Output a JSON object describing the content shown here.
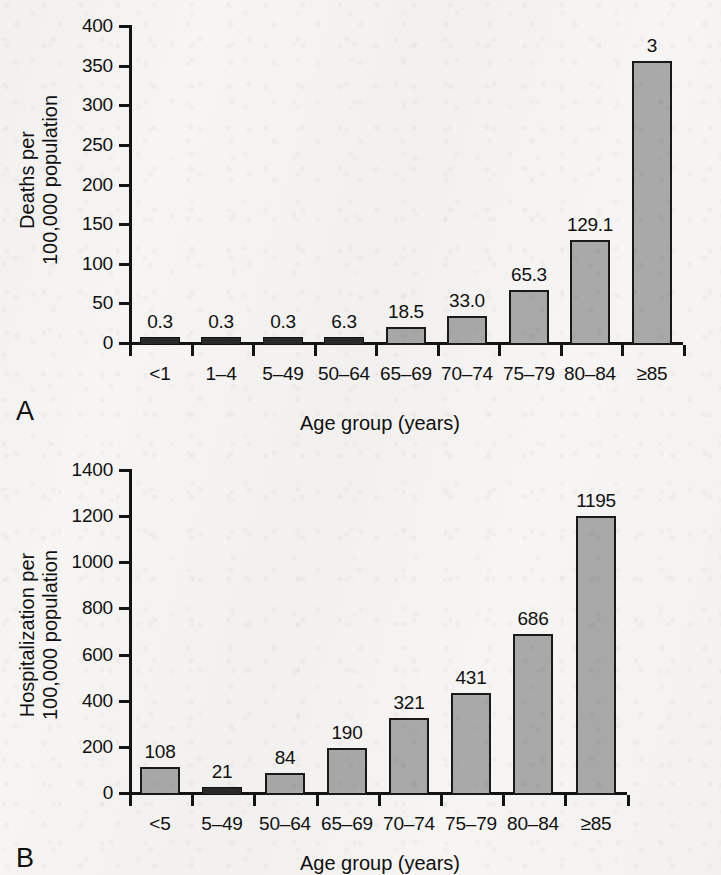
{
  "figure": {
    "background_color": "#f6f5f3",
    "bar_fill_color": "#a9a9a9",
    "bar_border_color": "#1a1a1a",
    "axis_color": "#141414"
  },
  "panels": [
    {
      "letter": "A",
      "xlabel": "Age group (years)",
      "ylabel_line1": "Deaths per",
      "ylabel_line2": "100,000 population"
    },
    {
      "letter": "B",
      "xlabel": "Age group (years)",
      "ylabel_line1": "Hospitalization per",
      "ylabel_line2": "100,000 population"
    }
  ],
  "chart_data": [
    {
      "type": "bar",
      "title": "",
      "panel": "A",
      "categories": [
        "<1",
        "1–4",
        "5–49",
        "50–64",
        "65–69",
        "70–74",
        "75–79",
        "80–84",
        "≥85"
      ],
      "values": [
        0.3,
        0.3,
        0.3,
        6.3,
        18.5,
        33.0,
        65.3,
        129.1,
        355
      ],
      "data_labels": [
        "0.3",
        "0.3",
        "0.3",
        "6.3",
        "18.5",
        "33.0",
        "65.3",
        "129.1",
        "3"
      ],
      "xlabel": "Age group (years)",
      "ylabel": "Deaths per 100,000 population",
      "ylim": [
        0,
        400
      ],
      "yticks": [
        0,
        50,
        100,
        150,
        200,
        250,
        300,
        350,
        400
      ],
      "ytick_labels": [
        "0",
        "50",
        "100",
        "150",
        "200",
        "250",
        "300",
        "350",
        "400"
      ],
      "grid": false,
      "legend": "none",
      "note": "rightmost category is cropped off the right edge of the image"
    },
    {
      "type": "bar",
      "title": "",
      "panel": "B",
      "categories": [
        "<5",
        "5–49",
        "50–64",
        "65–69",
        "70–74",
        "75–79",
        "80–84",
        "≥85"
      ],
      "values": [
        108,
        21,
        84,
        190,
        321,
        431,
        686,
        1195
      ],
      "data_labels": [
        "108",
        "21",
        "84",
        "190",
        "321",
        "431",
        "686",
        "1195"
      ],
      "xlabel": "Age group (years)",
      "ylabel": "Hospitalization per 100,000 population",
      "ylim": [
        0,
        1400
      ],
      "yticks": [
        0,
        200,
        400,
        600,
        800,
        1000,
        1200,
        1400
      ],
      "ytick_labels": [
        "0",
        "200",
        "400",
        "600",
        "800",
        "1000",
        "1200",
        "1400"
      ],
      "grid": false,
      "legend": "none"
    }
  ]
}
